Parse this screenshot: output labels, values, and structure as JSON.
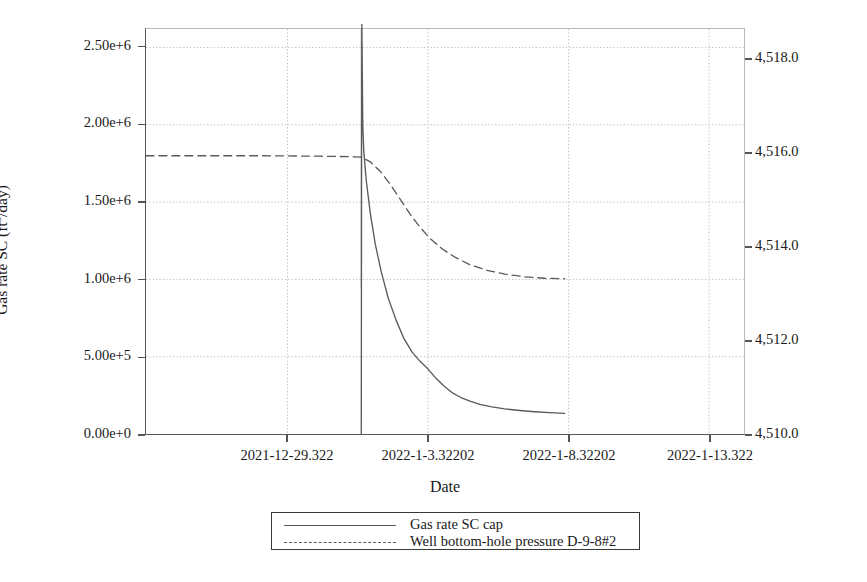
{
  "chart_data": {
    "type": "line",
    "title": "",
    "xlabel": "Date",
    "ylabel": "Gas rate SC (ft3/day)",
    "ylabel_right": "Well bottom-hole pressure (psi)",
    "grid": true,
    "legend_position": "bottom",
    "x_tick_labels": [
      "2021-12-29.322",
      "2022-1-3.32202",
      "2022-1-8.32202",
      "2022-1-13.322"
    ],
    "x_tick_positions": [
      287,
      428,
      569,
      710
    ],
    "xlim_labels": [
      "2021-12-27.5",
      "2022-1-15.3"
    ],
    "y_left_ticks": [
      "0.00e+0",
      "5.00e+5",
      "1.00e+6",
      "1.50e+6",
      "2.00e+6",
      "2.50e+6"
    ],
    "y_left_values": [
      0,
      500000,
      1000000,
      1500000,
      2000000,
      2500000
    ],
    "ylim_left": [
      0,
      2620000
    ],
    "y_right_ticks": [
      "4,510.0",
      "4,512.0",
      "4,514.0",
      "4,516.0",
      "4,518.0"
    ],
    "y_right_values": [
      4510.0,
      4512.0,
      4514.0,
      4516.0,
      4518.0
    ],
    "ylim_right": [
      4510.0,
      4518.66
    ],
    "vertical_marker_x_label": "2022-1-1.0",
    "series": [
      {
        "name": "Gas rate SC cap",
        "axis": "left",
        "style": "solid",
        "color": "#5a5a5a",
        "points": [
          [
            361.0,
            0
          ],
          [
            361.3,
            1830000
          ],
          [
            361.6,
            2650000
          ],
          [
            362.5,
            2000000
          ],
          [
            363.5,
            1830000
          ],
          [
            366,
            1640000
          ],
          [
            370,
            1430000
          ],
          [
            375,
            1230000
          ],
          [
            381,
            1050000
          ],
          [
            388,
            880000
          ],
          [
            396,
            735000
          ],
          [
            404,
            615000
          ],
          [
            412,
            530000
          ],
          [
            420,
            470000
          ],
          [
            428,
            420000
          ],
          [
            436,
            360000
          ],
          [
            444,
            310000
          ],
          [
            452,
            268000
          ],
          [
            461,
            236000
          ],
          [
            470,
            212000
          ],
          [
            480,
            192000
          ],
          [
            492,
            175000
          ],
          [
            505,
            162000
          ],
          [
            520,
            152000
          ],
          [
            535,
            144000
          ],
          [
            550,
            138000
          ],
          [
            565,
            133000
          ]
        ]
      },
      {
        "name": "Well bottom-hole pressure D-9-8#2",
        "axis": "right",
        "style": "dashed",
        "color": "#5a5a5a",
        "points": [
          [
            145,
            4515.95
          ],
          [
            200,
            4515.95
          ],
          [
            260,
            4515.95
          ],
          [
            320,
            4515.94
          ],
          [
            350,
            4515.93
          ],
          [
            361,
            4515.92
          ],
          [
            370,
            4515.82
          ],
          [
            380,
            4515.62
          ],
          [
            390,
            4515.34
          ],
          [
            400,
            4515.02
          ],
          [
            410,
            4514.7
          ],
          [
            420,
            4514.42
          ],
          [
            430,
            4514.18
          ],
          [
            442,
            4513.96
          ],
          [
            455,
            4513.78
          ],
          [
            470,
            4513.62
          ],
          [
            487,
            4513.5
          ],
          [
            505,
            4513.42
          ],
          [
            525,
            4513.36
          ],
          [
            545,
            4513.33
          ],
          [
            565,
            4513.32
          ]
        ]
      }
    ],
    "legend_entries": [
      {
        "label": "Gas rate SC cap",
        "style": "solid"
      },
      {
        "label": "Well bottom-hole pressure D-9-8#2",
        "style": "dashed"
      }
    ],
    "colors": {
      "axis": "#555555",
      "grid": "#b9b9b9",
      "series": "#5a5a5a",
      "text": "#1a1a1a",
      "background": "#ffffff"
    }
  }
}
